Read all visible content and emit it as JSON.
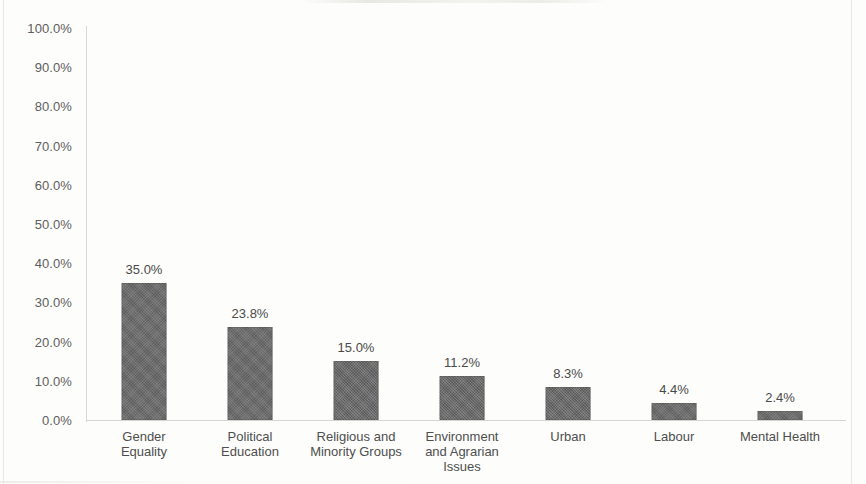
{
  "chart_data": {
    "type": "bar",
    "title": "",
    "subtitle": "",
    "xlabel": "",
    "ylabel": "",
    "ylim": [
      0,
      100
    ],
    "grid": false,
    "legend": false,
    "value_label_format": "percent-one-decimal",
    "categories": [
      "Gender Equality",
      "Political Education",
      "Religious and Minority Groups",
      "Environment and Agrarian Issues",
      "Urban",
      "Labour",
      "Mental Health"
    ],
    "category_label_lines": [
      [
        "Gender",
        "Equality"
      ],
      [
        "Political",
        "Education"
      ],
      [
        "Religious and",
        "Minority Groups"
      ],
      [
        "Environment",
        "and Agrarian",
        "Issues"
      ],
      [
        "Urban"
      ],
      [
        "Labour"
      ],
      [
        "Mental Health"
      ]
    ],
    "values": [
      35.0,
      23.8,
      15.0,
      11.2,
      8.3,
      4.4,
      2.4
    ],
    "value_labels": [
      "35.0%",
      "23.8%",
      "15.0%",
      "11.2%",
      "8.3%",
      "4.4%",
      "2.4%"
    ],
    "y_ticks": [
      0,
      10,
      20,
      30,
      40,
      50,
      60,
      70,
      80,
      90,
      100
    ],
    "y_tick_labels": [
      "100.0%",
      "90.0%",
      "80.0%",
      "70.0%",
      "60.0%",
      "50.0%",
      "40.0%",
      "30.0%",
      "20.0%",
      "10.0%",
      "0.0%"
    ],
    "colors": {
      "bar_fill": "#676767",
      "background": "#fdfdfb",
      "axis": "#d5d5d1",
      "tick_text": "#5e5e5e",
      "value_text": "#4a4a4a",
      "category_text": "#4e4e4e"
    }
  }
}
